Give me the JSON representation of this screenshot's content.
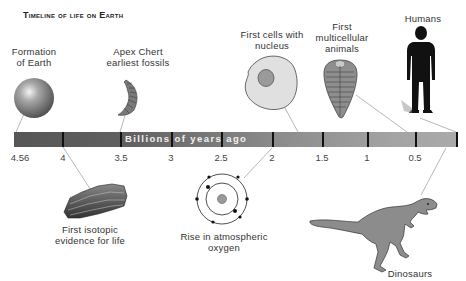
{
  "title": "Timeline of life on Earth",
  "timeline": {
    "axis_label": "Billions of years ago",
    "ticks": [
      {
        "label": "4.56",
        "x": 20
      },
      {
        "label": "4",
        "x": 63
      },
      {
        "label": "3.5",
        "x": 121
      },
      {
        "label": "3",
        "x": 171
      },
      {
        "label": "2.5",
        "x": 221
      },
      {
        "label": "2",
        "x": 272
      },
      {
        "label": "1.5",
        "x": 322
      },
      {
        "label": "1",
        "x": 367
      },
      {
        "label": "0.5",
        "x": 415
      }
    ],
    "colors": {
      "start": "#565656",
      "end": "#aaaaaa",
      "tick": "#111111"
    }
  },
  "events": [
    {
      "id": "formation",
      "label_line1": "Formation",
      "label_line2": "of Earth",
      "icon": "planet-sphere"
    },
    {
      "id": "apex",
      "label_line1": "Apex Chert",
      "label_line2": "earliest fossils",
      "icon": "fossil-filament"
    },
    {
      "id": "isotopic",
      "label_line1": "First isotopic",
      "label_line2": "evidence for life",
      "icon": "rock-layers"
    },
    {
      "id": "oxygen",
      "label_line1": "Rise in atmospheric",
      "label_line2": "oxygen",
      "icon": "oxygen-atom"
    },
    {
      "id": "cells",
      "label_line1": "First cells with",
      "label_line2": "nucleus",
      "icon": "eukaryotic-cell"
    },
    {
      "id": "multicellular",
      "label_line1": "First",
      "label_line2": "multicellular",
      "label_line3": "animals",
      "icon": "trilobite"
    },
    {
      "id": "dinosaurs",
      "label_line1": "Dinosaurs",
      "icon": "dinosaur"
    },
    {
      "id": "humans",
      "label_line1": "Humans",
      "icon": "human-silhouette"
    }
  ]
}
